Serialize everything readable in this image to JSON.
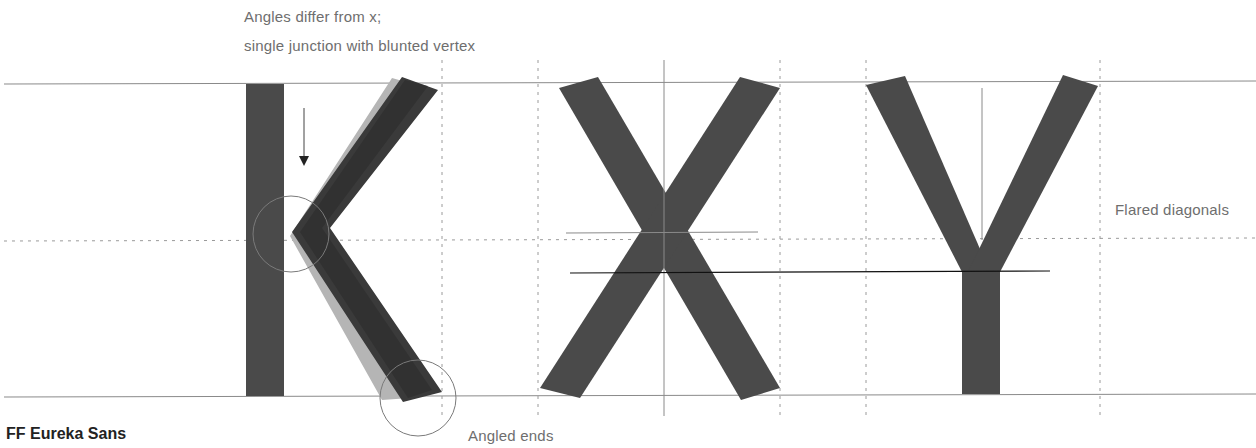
{
  "caption": {
    "font_name": "FF Eureka Sans"
  },
  "annotations": {
    "angles_note_line1": "Angles differ from x;",
    "angles_note_line2": "single junction with blunted vertex",
    "flared": "Flared diagonals",
    "angled_ends": "Angled ends"
  },
  "glyphs": [
    "K",
    "X",
    "Y"
  ],
  "colors": {
    "glyph_fill": "#4a4a4a",
    "glyph_dark": "#2b2b2b",
    "glyph_ghost": "#b5b5b5",
    "guide_line": "#8a8a8a",
    "dotted_guide": "#9a9a9a",
    "reference_black": "#111111",
    "annotation_text": "#6e6e6e"
  }
}
